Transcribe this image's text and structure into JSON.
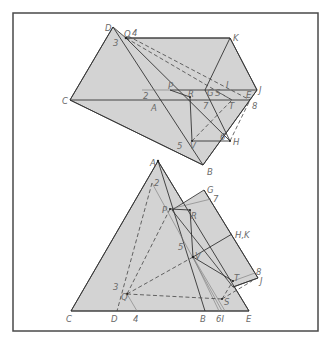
{
  "colors": {
    "face_fill": "#d3d3d3",
    "line": "#333333",
    "label": "#6a6a6a",
    "frame": "#4a4a4a",
    "background": "#ffffff"
  },
  "top_figure": {
    "labels": {
      "D": "D",
      "Q": "Q",
      "four": "4",
      "three": "3",
      "K": "K",
      "C": "C",
      "two": "2",
      "P": "P",
      "R": "R",
      "A": "A",
      "G": "G",
      "S": "S",
      "I": "I",
      "J": "J",
      "E": "E",
      "seven": "7",
      "T": "T",
      "eight": "8",
      "five": "5",
      "V": "V",
      "six": "6",
      "H": "H",
      "B": "B"
    }
  },
  "bottom_figure": {
    "labels": {
      "A": "A",
      "two": "2",
      "G": "G",
      "seven": "7",
      "P": "P",
      "R": "R",
      "HK": "H,K",
      "five": "5",
      "V": "V",
      "eight": "8",
      "J": "J",
      "T": "T",
      "three": "3",
      "Q": "Q",
      "S": "S",
      "C": "C",
      "D": "D",
      "four": "4",
      "B": "B",
      "six_I": "6I",
      "E": "E"
    }
  }
}
